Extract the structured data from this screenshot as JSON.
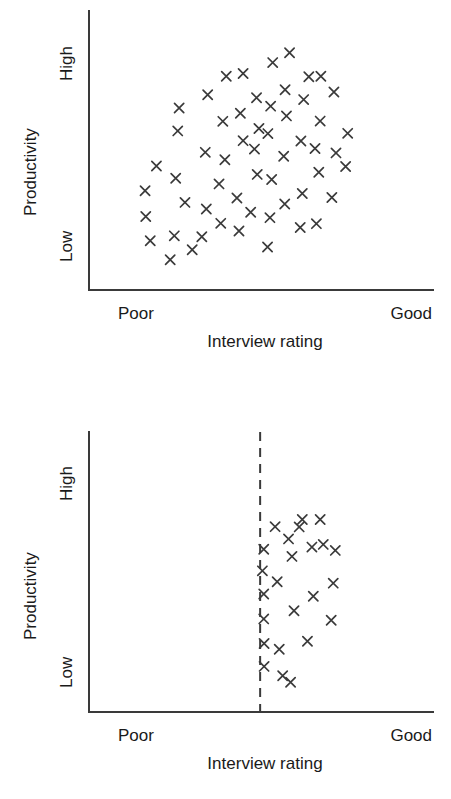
{
  "page": {
    "background_color": "#ffffff",
    "ink_color": "#3a3a3a",
    "text_color": "#1a1a1a"
  },
  "charts": [
    {
      "id": "top",
      "panel_name": "unrestricted-range-scatter",
      "axis": {
        "y_title": "Productivity",
        "y_high_label": "High",
        "y_low_label": "Low",
        "x_title": "Interview rating",
        "x_low_label": "Poor",
        "x_high_label": "Good"
      }
    },
    {
      "id": "bottom",
      "panel_name": "restricted-range-scatter",
      "axis": {
        "y_title": "Productivity",
        "y_high_label": "High",
        "y_low_label": "Low",
        "x_title": "Interview rating",
        "x_low_label": "Poor",
        "x_high_label": "Good"
      },
      "cutoff": {
        "name": "selection-cutoff-line",
        "style": "dashed",
        "x_fraction": 0.4975
      }
    }
  ],
  "chart_data": [
    {
      "type": "scatter",
      "id": "top",
      "title": "",
      "xlabel": "Interview rating",
      "ylabel": "Productivity",
      "xlim": [
        0,
        1
      ],
      "ylim": [
        0,
        1
      ],
      "xtick_labels": [
        "Poor",
        "Good"
      ],
      "ytick_labels": [
        "Low",
        "High"
      ],
      "grid": false,
      "legend": null,
      "marker": "x",
      "n_points": 56,
      "description": "Full unrestricted range: positive correlation between interview rating and productivity across the whole rating scale.",
      "points": [
        [
          0.178,
          0.181
        ],
        [
          0.165,
          0.27
        ],
        [
          0.163,
          0.365
        ],
        [
          0.196,
          0.456
        ],
        [
          0.236,
          0.111
        ],
        [
          0.248,
          0.199
        ],
        [
          0.279,
          0.322
        ],
        [
          0.252,
          0.411
        ],
        [
          0.258,
          0.585
        ],
        [
          0.262,
          0.669
        ],
        [
          0.3,
          0.148
        ],
        [
          0.328,
          0.196
        ],
        [
          0.341,
          0.298
        ],
        [
          0.338,
          0.506
        ],
        [
          0.345,
          0.718
        ],
        [
          0.383,
          0.245
        ],
        [
          0.378,
          0.39
        ],
        [
          0.395,
          0.479
        ],
        [
          0.389,
          0.62
        ],
        [
          0.399,
          0.786
        ],
        [
          0.436,
          0.217
        ],
        [
          0.43,
          0.338
        ],
        [
          0.448,
          0.549
        ],
        [
          0.44,
          0.65
        ],
        [
          0.448,
          0.796
        ],
        [
          0.47,
          0.286
        ],
        [
          0.489,
          0.425
        ],
        [
          0.481,
          0.518
        ],
        [
          0.494,
          0.594
        ],
        [
          0.487,
          0.707
        ],
        [
          0.519,
          0.158
        ],
        [
          0.526,
          0.266
        ],
        [
          0.531,
          0.406
        ],
        [
          0.52,
          0.575
        ],
        [
          0.528,
          0.676
        ],
        [
          0.534,
          0.836
        ],
        [
          0.569,
          0.316
        ],
        [
          0.566,
          0.492
        ],
        [
          0.574,
          0.64
        ],
        [
          0.57,
          0.736
        ],
        [
          0.583,
          0.872
        ],
        [
          0.614,
          0.23
        ],
        [
          0.62,
          0.355
        ],
        [
          0.616,
          0.548
        ],
        [
          0.624,
          0.7
        ],
        [
          0.639,
          0.784
        ],
        [
          0.661,
          0.244
        ],
        [
          0.668,
          0.433
        ],
        [
          0.657,
          0.52
        ],
        [
          0.672,
          0.621
        ],
        [
          0.674,
          0.786
        ],
        [
          0.706,
          0.34
        ],
        [
          0.718,
          0.504
        ],
        [
          0.712,
          0.728
        ],
        [
          0.746,
          0.454
        ],
        [
          0.752,
          0.576
        ]
      ]
    },
    {
      "type": "scatter",
      "id": "bottom",
      "title": "",
      "xlabel": "Interview rating",
      "ylabel": "Productivity",
      "xlim": [
        0,
        1
      ],
      "ylim": [
        0,
        1
      ],
      "xtick_labels": [
        "Poor",
        "Good"
      ],
      "ytick_labels": [
        "Low",
        "High"
      ],
      "grid": false,
      "legend": null,
      "marker": "x",
      "n_points": 24,
      "cutoff_x": 0.4975,
      "description": "Range restricted to applicants above the cutoff: the correlation visibly flattens.",
      "points": [
        [
          0.508,
          0.596
        ],
        [
          0.504,
          0.517
        ],
        [
          0.508,
          0.432
        ],
        [
          0.508,
          0.341
        ],
        [
          0.509,
          0.251
        ],
        [
          0.509,
          0.167
        ],
        [
          0.541,
          0.679
        ],
        [
          0.547,
          0.477
        ],
        [
          0.553,
          0.23
        ],
        [
          0.563,
          0.133
        ],
        [
          0.58,
          0.634
        ],
        [
          0.59,
          0.57
        ],
        [
          0.596,
          0.371
        ],
        [
          0.586,
          0.109
        ],
        [
          0.611,
          0.678
        ],
        [
          0.62,
          0.705
        ],
        [
          0.635,
          0.259
        ],
        [
          0.648,
          0.604
        ],
        [
          0.652,
          0.424
        ],
        [
          0.672,
          0.705
        ],
        [
          0.681,
          0.614
        ],
        [
          0.704,
          0.336
        ],
        [
          0.71,
          0.472
        ],
        [
          0.716,
          0.592
        ]
      ]
    }
  ]
}
